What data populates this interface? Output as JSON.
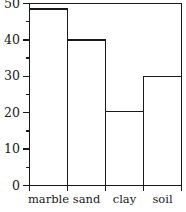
{
  "chart_data": {
    "type": "bar",
    "title": "",
    "subtitle": "",
    "xlabel": "",
    "ylabel": "",
    "categories": [
      "marble",
      "sand",
      "clay",
      "soil"
    ],
    "values": [
      48.5,
      40,
      20.3,
      30
    ],
    "series": [
      {
        "name": "",
        "values": [
          48.5,
          40,
          20.3,
          30
        ]
      }
    ],
    "ylim": [
      0,
      50
    ],
    "xlim": [
      0,
      4
    ],
    "y_major_ticks": [
      0,
      10,
      20,
      30,
      40,
      50
    ],
    "y_major_tick_labels": [
      "0",
      "10",
      "20",
      "30",
      "40",
      "50"
    ],
    "y_minor_ticks": [
      5,
      15,
      25,
      35,
      45
    ],
    "grid": false,
    "legend": false,
    "legend_position": "none",
    "bar_style": "outlined-adjacent",
    "bar_fill": "#ffffff",
    "bar_edge_color": "#1a1a1a",
    "axis_color": "#1a1a1a",
    "background": "#ffffff",
    "frame": {
      "top": true,
      "right": true,
      "bottom": true,
      "left": true
    },
    "tick_direction": "out"
  }
}
